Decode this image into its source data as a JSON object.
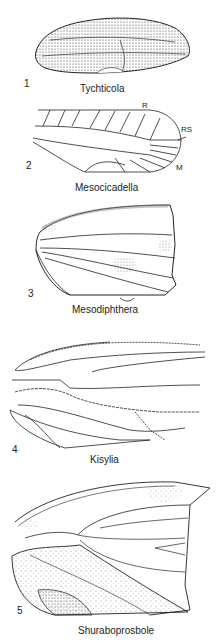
{
  "figures": [
    {
      "number": "1",
      "name": "Tychticola"
    },
    {
      "number": "2",
      "name": "Mesocicadella",
      "vein_labels": [
        "R",
        "RS",
        "M"
      ]
    },
    {
      "number": "3",
      "name": "Mesodiphthera"
    },
    {
      "number": "4",
      "name": "Kisylia"
    },
    {
      "number": "5",
      "name": "Shuraboprosbole"
    }
  ],
  "colors": {
    "ink": "#222222",
    "stipple": "#bbbbbb",
    "background": "#ffffff"
  }
}
